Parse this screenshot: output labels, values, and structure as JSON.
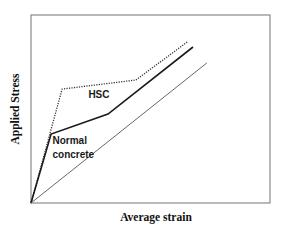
{
  "chart_data": {
    "type": "line",
    "title": "",
    "xlabel": "Average strain",
    "ylabel": "Applied Stress",
    "xlim": [
      0,
      100
    ],
    "ylim": [
      0,
      100
    ],
    "grid": false,
    "ticks": "none",
    "series": [
      {
        "name": "HSC",
        "style": "dotted",
        "color": "#333333",
        "points": [
          [
            0,
            0
          ],
          [
            13.0,
            60.6
          ],
          [
            43.9,
            65.4
          ],
          [
            65.3,
            85.6
          ]
        ]
      },
      {
        "name": "Normal concrete",
        "style": "solid-thick",
        "color": "#1a1a1a",
        "points": [
          [
            0,
            0
          ],
          [
            8.4,
            36.7
          ],
          [
            32.2,
            47.3
          ],
          [
            67.8,
            83.0
          ]
        ]
      },
      {
        "name": "Reference",
        "style": "solid-thin",
        "color": "#555555",
        "points": [
          [
            0,
            0
          ],
          [
            73.6,
            74.5
          ]
        ]
      }
    ],
    "annotations": [
      {
        "text": "HSC",
        "x": 24,
        "y": 56
      },
      {
        "text": "Normal",
        "x": 9,
        "y": 31.5
      },
      {
        "text": "concrete",
        "x": 9,
        "y": 24
      }
    ]
  }
}
